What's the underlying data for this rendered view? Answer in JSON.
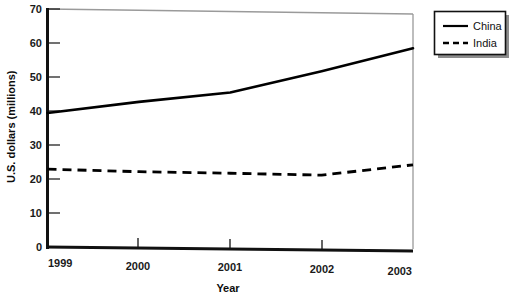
{
  "chart_data": {
    "type": "line",
    "title": "",
    "subtitle": "",
    "xlabel": "Year",
    "ylabel": "U.S. dollars (millions)",
    "categories": [
      "1999",
      "2000",
      "2001",
      "2002",
      "2003"
    ],
    "x": [
      1999,
      2000,
      2001,
      2002,
      2003
    ],
    "xlim": [
      1999,
      2003
    ],
    "ylim": [
      0,
      70
    ],
    "y_ticks": [
      0,
      10,
      20,
      30,
      40,
      50,
      60,
      70
    ],
    "y_tick_labels": [
      "0",
      "10",
      "20",
      "30",
      "40",
      "50",
      "60",
      "70"
    ],
    "x_tick_labels": [
      "1999",
      "2000",
      "2001",
      "2002",
      "2003"
    ],
    "grid": false,
    "legend_position": "top-right outside",
    "series": [
      {
        "name": "China",
        "style": "solid",
        "color": "#000000",
        "values": [
          39.5,
          43.0,
          46.0,
          52.5,
          59.5
        ]
      },
      {
        "name": "India",
        "style": "dashed",
        "color": "#000000",
        "values": [
          23.0,
          22.5,
          22.3,
          22.0,
          25.3
        ]
      }
    ]
  },
  "axes": {
    "y_label": "U.S. dollars (millions)",
    "x_label": "Year",
    "y_tick_labels": [
      "70",
      "60",
      "50",
      "40",
      "30",
      "20",
      "10",
      "0"
    ],
    "x_tick_labels": [
      "1999",
      "2000",
      "2001",
      "2002",
      "2003"
    ]
  },
  "legend": {
    "entries": [
      {
        "label": "China",
        "style": "solid"
      },
      {
        "label": "India",
        "style": "dashed"
      }
    ]
  },
  "colors": {
    "line": "#000000",
    "axis": "#111111",
    "plot_border": "#9a9a9a",
    "legend_border": "#111111",
    "legend_shadow": "#8c8c8c",
    "background": "#ffffff"
  }
}
